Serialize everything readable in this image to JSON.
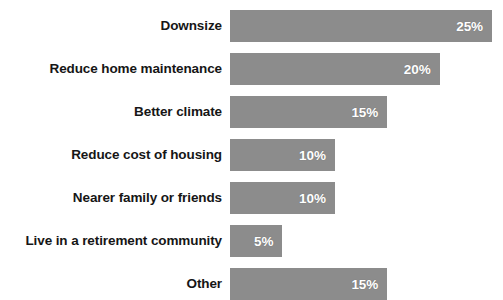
{
  "chart_data": {
    "type": "bar",
    "orientation": "horizontal",
    "title": "",
    "subtitle": "",
    "xlabel": "",
    "ylabel": "",
    "grid": false,
    "legend": false,
    "legend_position": "none",
    "axis_visible": false,
    "xlim": [
      0,
      25
    ],
    "value_suffix": "%",
    "bar_color": "#8c8c8c",
    "value_label_color": "#ffffff",
    "category_label_color": "#161616",
    "background_color": "#ffffff",
    "categories": [
      "Downsize",
      "Reduce home maintenance",
      "Better climate",
      "Reduce cost of housing",
      "Nearer family or friends",
      "Live in a retirement community",
      "Other"
    ],
    "values": [
      25,
      20,
      15,
      10,
      10,
      5,
      15
    ],
    "value_labels": [
      "25%",
      "20%",
      "15%",
      "10%",
      "10%",
      "5%",
      "15%"
    ],
    "bars": [
      {
        "label": "Downsize",
        "value": 25,
        "value_label": "25%"
      },
      {
        "label": "Reduce home maintenance",
        "value": 20,
        "value_label": "20%"
      },
      {
        "label": "Better climate",
        "value": 15,
        "value_label": "15%"
      },
      {
        "label": "Reduce cost of housing",
        "value": 10,
        "value_label": "10%"
      },
      {
        "label": "Nearer family or friends",
        "value": 10,
        "value_label": "10%"
      },
      {
        "label": "Live in a retirement community",
        "value": 5,
        "value_label": "5%"
      },
      {
        "label": "Other",
        "value": 15,
        "value_label": "15%"
      }
    ]
  },
  "layout": {
    "label_column_width": 222,
    "bar_origin_x": 230,
    "bar_height": 32,
    "row_pitch": 43,
    "first_row_top": 10,
    "px_per_unit": 10.48
  }
}
